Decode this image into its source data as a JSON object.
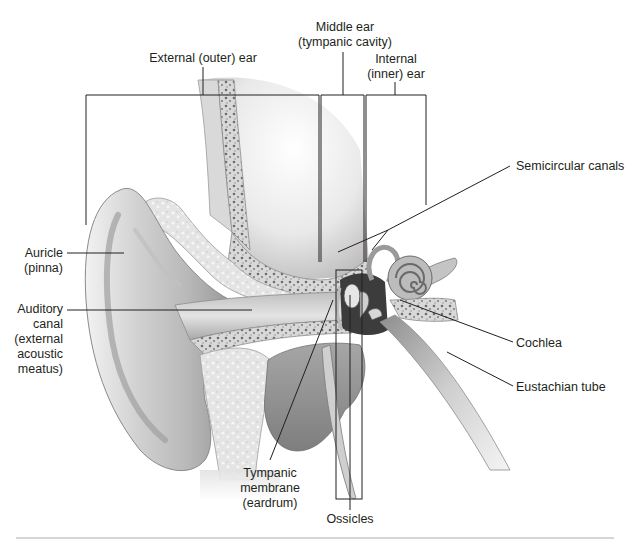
{
  "diagram": {
    "type": "anatomical illustration",
    "style": "grayscale shaded illustration",
    "colors": {
      "background": "#ffffff",
      "leader_line": "#231f20",
      "label_text": "#231f20",
      "bottom_rule": "#c8c8c8",
      "skin_light": "#e6e6e6",
      "skin_mid": "#bdbdbd",
      "skin_dark": "#8a8a8a",
      "bone": "#dcdcdc",
      "bone_pores": "#6e6e6e"
    }
  },
  "regions": {
    "external_ear": {
      "lines": [
        "External (outer) ear"
      ]
    },
    "middle_ear": {
      "lines": [
        "Middle ear",
        "(tympanic cavity)"
      ]
    },
    "internal_ear": {
      "lines": [
        "Internal",
        "(inner) ear"
      ]
    }
  },
  "labels": {
    "auricle": {
      "lines": [
        "Auricle",
        "(pinna)"
      ]
    },
    "auditory_canal": {
      "lines": [
        "Auditory",
        "canal",
        "(external",
        "acoustic",
        "meatus)"
      ]
    },
    "semicircular_canals": {
      "lines": [
        "Semicircular canals"
      ]
    },
    "cochlea": {
      "lines": [
        "Cochlea"
      ]
    },
    "eustachian_tube": {
      "lines": [
        "Eustachian tube"
      ]
    },
    "tympanic_membrane": {
      "lines": [
        "Tympanic",
        "membrane",
        "(eardrum)"
      ]
    },
    "ossicles": {
      "lines": [
        "Ossicles"
      ]
    }
  }
}
